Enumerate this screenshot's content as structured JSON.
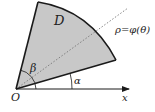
{
  "diagram": {
    "labels": {
      "region": "D",
      "curve": "ρ=φ(θ)",
      "angle_upper": "β",
      "angle_lower": "α",
      "origin": "O",
      "axis": "x"
    },
    "colors": {
      "region_fill": "#c8c8c8",
      "stroke": "#1a1a1a",
      "dotted_ray": "#777777",
      "background": "#ffffff"
    },
    "elements": [
      "shaded sector region D",
      "upper boundary ray at angle β",
      "lower boundary ray at angle α",
      "outer arc ρ=φ(θ)",
      "dotted radial ray",
      "x-axis with arrow",
      "angle arcs for α and β"
    ]
  }
}
